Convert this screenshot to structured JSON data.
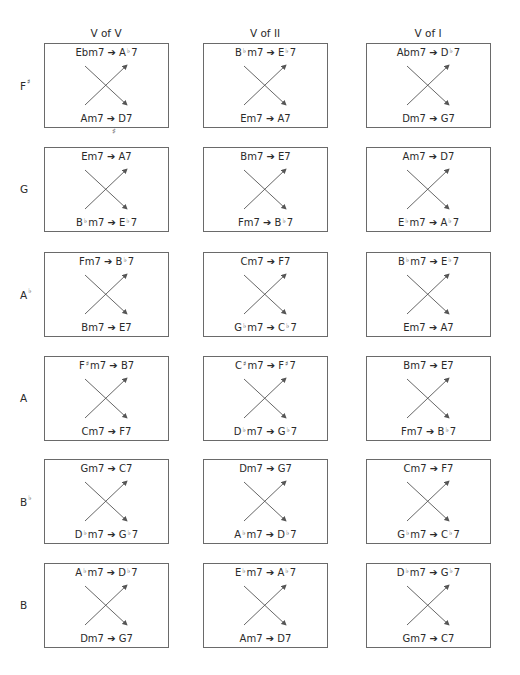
{
  "columns": [
    {
      "label": "V of V"
    },
    {
      "label": "V of II"
    },
    {
      "label": "V of I"
    }
  ],
  "rows": [
    {
      "key": "F♯",
      "key_root": "F",
      "key_accidental": "♯",
      "cells": [
        {
          "top": [
            "Ebm7",
            "A♭7"
          ],
          "bottom": [
            "Am7",
            "D7"
          ]
        },
        {
          "top": [
            "B♭m7",
            "E♭7"
          ],
          "bottom": [
            "Em7",
            "A7"
          ]
        },
        {
          "top": [
            "Abm7",
            "D♭7"
          ],
          "bottom": [
            "Dm7",
            "G7"
          ]
        }
      ]
    },
    {
      "key": "G",
      "key_root": "G",
      "key_accidental": "",
      "cells": [
        {
          "top": [
            "Em7",
            "A7"
          ],
          "bottom": [
            "B♭m7",
            "E♭7"
          ]
        },
        {
          "top": [
            "Bm7",
            "E7"
          ],
          "bottom": [
            "Fm7",
            "B♭7"
          ]
        },
        {
          "top": [
            "Am7",
            "D7"
          ],
          "bottom": [
            "E♭m7",
            "A♭7"
          ]
        }
      ]
    },
    {
      "key": "A♭",
      "key_root": "A",
      "key_accidental": "♭",
      "cells": [
        {
          "top": [
            "Fm7",
            "B♭7"
          ],
          "bottom": [
            "Bm7",
            "E7"
          ]
        },
        {
          "top": [
            "Cm7",
            "F7"
          ],
          "bottom": [
            "G♭m7",
            "C♭7"
          ]
        },
        {
          "top": [
            "B♭m7",
            "E♭7"
          ],
          "bottom": [
            "Em7",
            "A7"
          ]
        }
      ]
    },
    {
      "key": "A",
      "key_root": "A",
      "key_accidental": "",
      "cells": [
        {
          "top": [
            "F♯m7",
            "B7"
          ],
          "bottom": [
            "Cm7",
            "F7"
          ]
        },
        {
          "top": [
            "C♯m7",
            "F♯7"
          ],
          "bottom": [
            "D♭m7",
            "G♭7"
          ]
        },
        {
          "top": [
            "Bm7",
            "E7"
          ],
          "bottom": [
            "Fm7",
            "B♭7"
          ]
        }
      ]
    },
    {
      "key": "B♭",
      "key_root": "B",
      "key_accidental": "♭",
      "cells": [
        {
          "top": [
            "Gm7",
            "C7"
          ],
          "bottom": [
            "D♭m7",
            "G♭7"
          ]
        },
        {
          "top": [
            "Dm7",
            "G7"
          ],
          "bottom": [
            "A♭m7",
            "D♭7"
          ]
        },
        {
          "top": [
            "Cm7",
            "F7"
          ],
          "bottom": [
            "G♭m7",
            "C♭7"
          ]
        }
      ]
    },
    {
      "key": "B",
      "key_root": "B",
      "key_accidental": "",
      "cells": [
        {
          "top": [
            "A♭m7",
            "D♭7"
          ],
          "bottom": [
            "Dm7",
            "G7"
          ]
        },
        {
          "top": [
            "E♭m7",
            "A♭7"
          ],
          "bottom": [
            "Am7",
            "D7"
          ]
        },
        {
          "top": [
            "D♭m7",
            "G♭7"
          ],
          "bottom": [
            "Gm7",
            "C7"
          ]
        }
      ]
    }
  ],
  "arrow_glyph": "➔",
  "stray_mark": "♯",
  "colors": {
    "line": "#555555",
    "border": "#6a6a6a",
    "text": "#2a2a2a"
  }
}
